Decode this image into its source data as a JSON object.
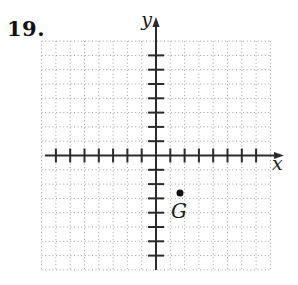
{
  "problem_number": "19.",
  "figure": {
    "type": "coordinate-plane",
    "axis_labels": {
      "x": "x",
      "y": "y"
    },
    "point": {
      "label": "G",
      "px": {
        "x": 180,
        "y": 193
      },
      "approx_units": {
        "x": 1.7,
        "y": -2.7
      },
      "radius_px": 3.5
    },
    "colors": {
      "background": "#ffffff",
      "axis": "#2b2b2b",
      "grid_dots": "#9b9b9b",
      "point": "#111111",
      "text": "#111111"
    },
    "geometry": {
      "origin_px": {
        "x": 156,
        "y": 155.5
      },
      "unit_px": 14.3,
      "grid_lines_each_side": 8,
      "x_ticks_negative": 7,
      "x_ticks_positive": 7,
      "y_ticks_negative": 7,
      "y_ticks_positive": 7,
      "x_axis": {
        "start_px": 45,
        "end_px": 276,
        "arrow_tip_px": 284
      },
      "y_axis": {
        "start_px": 270,
        "end_px": 25,
        "arrow_tip_px": 17
      },
      "tick_half_length_x": 7,
      "tick_half_length_y": 8,
      "axis_stroke_width": 2,
      "grid_dash": "1 2.6"
    }
  }
}
